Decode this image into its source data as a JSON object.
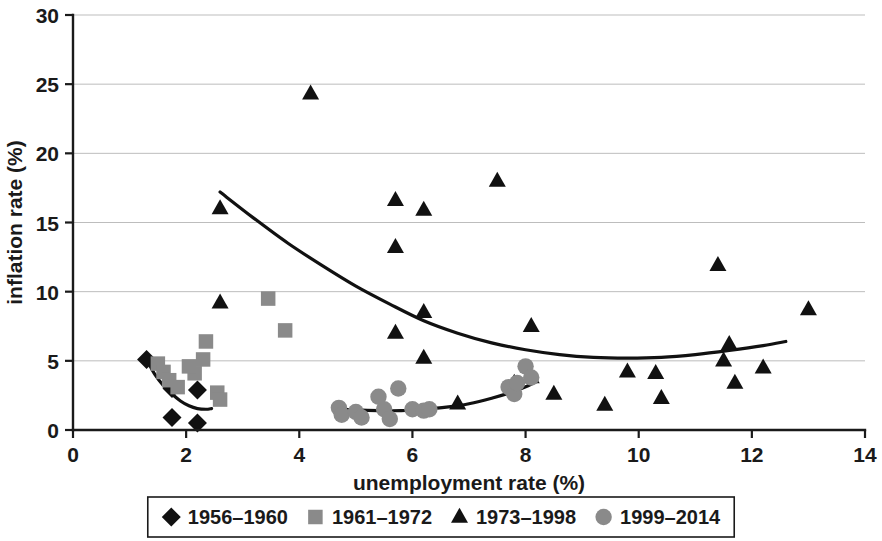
{
  "chart_data": {
    "type": "scatter",
    "title": "",
    "xlabel": "unemployment rate (%)",
    "ylabel": "inflation rate (%)",
    "xlim": [
      0,
      14
    ],
    "ylim": [
      0,
      30
    ],
    "xticks": [
      "0",
      "2",
      "4",
      "6",
      "8",
      "10",
      "12",
      "14"
    ],
    "xtick_values": [
      0,
      2,
      4,
      6,
      8,
      10,
      12,
      14
    ],
    "yticks": [
      "0",
      "5",
      "10",
      "15",
      "20",
      "25",
      "30"
    ],
    "ytick_values": [
      0,
      5,
      10,
      15,
      20,
      25,
      30
    ],
    "grid": "horizontal",
    "legend_position": "bottom",
    "marker_gray": "#8a8a8a",
    "marker_black": "#111111",
    "series": [
      {
        "name": "1956–1960",
        "marker": "diamond",
        "color": "#111111",
        "points": [
          [
            1.3,
            5.1
          ],
          [
            1.75,
            3.0
          ],
          [
            2.2,
            2.9
          ],
          [
            1.75,
            0.9
          ],
          [
            2.2,
            0.5
          ]
        ]
      },
      {
        "name": "1961–1972",
        "marker": "square",
        "color": "#8a8a8a",
        "points": [
          [
            1.5,
            4.8
          ],
          [
            1.6,
            4.2
          ],
          [
            1.7,
            3.6
          ],
          [
            1.85,
            3.1
          ],
          [
            2.15,
            4.1
          ],
          [
            2.3,
            5.1
          ],
          [
            2.35,
            6.4
          ],
          [
            2.55,
            2.7
          ],
          [
            2.6,
            2.2
          ],
          [
            2.05,
            4.6
          ],
          [
            3.45,
            9.5
          ],
          [
            3.75,
            7.2
          ]
        ]
      },
      {
        "name": "1973–1998",
        "marker": "triangle",
        "color": "#111111",
        "points": [
          [
            2.6,
            16.0
          ],
          [
            2.6,
            9.2
          ],
          [
            4.2,
            24.3
          ],
          [
            5.7,
            16.6
          ],
          [
            5.7,
            13.2
          ],
          [
            6.2,
            15.9
          ],
          [
            7.5,
            18.0
          ],
          [
            5.7,
            7.0
          ],
          [
            6.2,
            8.5
          ],
          [
            6.2,
            5.2
          ],
          [
            6.8,
            1.9
          ],
          [
            8.1,
            7.5
          ],
          [
            7.8,
            3.4
          ],
          [
            8.1,
            3.8
          ],
          [
            8.5,
            2.6
          ],
          [
            9.4,
            1.8
          ],
          [
            9.8,
            4.2
          ],
          [
            10.3,
            4.1
          ],
          [
            10.4,
            2.3
          ],
          [
            11.4,
            11.9
          ],
          [
            11.5,
            5.0
          ],
          [
            11.6,
            6.2
          ],
          [
            11.7,
            3.4
          ],
          [
            12.2,
            4.5
          ],
          [
            13.0,
            8.7
          ]
        ]
      },
      {
        "name": "1999–2014",
        "marker": "circle",
        "color": "#8a8a8a",
        "points": [
          [
            4.7,
            1.6
          ],
          [
            4.75,
            1.1
          ],
          [
            5.0,
            1.3
          ],
          [
            5.1,
            0.9
          ],
          [
            5.4,
            2.4
          ],
          [
            5.5,
            1.5
          ],
          [
            5.6,
            0.8
          ],
          [
            5.75,
            3.0
          ],
          [
            6.0,
            1.5
          ],
          [
            6.2,
            1.4
          ],
          [
            6.3,
            1.5
          ],
          [
            7.7,
            3.1
          ],
          [
            7.8,
            2.6
          ],
          [
            7.85,
            3.4
          ],
          [
            8.0,
            4.6
          ],
          [
            8.1,
            3.8
          ]
        ]
      }
    ],
    "trend_lines": [
      {
        "name": "upper-curve",
        "for_series": "1973–1998",
        "points": [
          [
            2.6,
            17.2
          ],
          [
            3.2,
            15.3
          ],
          [
            3.8,
            13.5
          ],
          [
            4.4,
            11.9
          ],
          [
            5.0,
            10.4
          ],
          [
            5.6,
            9.1
          ],
          [
            6.2,
            7.9
          ],
          [
            6.8,
            7.0
          ],
          [
            7.4,
            6.3
          ],
          [
            8.0,
            5.8
          ],
          [
            8.6,
            5.45
          ],
          [
            9.2,
            5.25
          ],
          [
            9.8,
            5.2
          ],
          [
            10.4,
            5.25
          ],
          [
            11.0,
            5.45
          ],
          [
            11.6,
            5.75
          ],
          [
            12.2,
            6.1
          ],
          [
            12.6,
            6.4
          ]
        ]
      },
      {
        "name": "lower-curve",
        "for_series": "1999–2014",
        "points": [
          [
            4.6,
            1.55
          ],
          [
            5.0,
            1.45
          ],
          [
            5.4,
            1.4
          ],
          [
            5.8,
            1.4
          ],
          [
            6.2,
            1.5
          ],
          [
            6.6,
            1.65
          ],
          [
            7.0,
            1.9
          ],
          [
            7.4,
            2.3
          ],
          [
            7.8,
            2.8
          ],
          [
            8.1,
            3.3
          ]
        ]
      },
      {
        "name": "left-curve",
        "for_series": "1956–1960",
        "points": [
          [
            1.3,
            5.1
          ],
          [
            1.45,
            4.0
          ],
          [
            1.6,
            3.2
          ],
          [
            1.75,
            2.6
          ],
          [
            1.9,
            2.1
          ],
          [
            2.05,
            1.75
          ],
          [
            2.2,
            1.55
          ],
          [
            2.35,
            1.5
          ],
          [
            2.45,
            1.55
          ]
        ]
      }
    ]
  },
  "legend": {
    "entries": [
      {
        "label": "1956–1960",
        "marker": "diamond"
      },
      {
        "label": "1961–1972",
        "marker": "square"
      },
      {
        "label": "1973–1998",
        "marker": "triangle"
      },
      {
        "label": "1999–2014",
        "marker": "circle"
      }
    ]
  }
}
